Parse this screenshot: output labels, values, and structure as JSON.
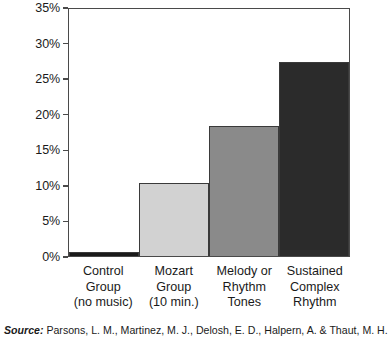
{
  "chart_data": {
    "type": "bar",
    "title": "",
    "subtitle": "",
    "xlabel": "",
    "ylabel": "",
    "categories": [
      "Control Group (no music)",
      "Mozart Group (10 min.)",
      "Melody or Rhythm Tones",
      "Sustained Complex Rhythm"
    ],
    "category_lines": [
      [
        "Control",
        "Group",
        "(no music)"
      ],
      [
        "Mozart",
        "Group",
        "(10 min.)"
      ],
      [
        "Melody or",
        "Rhythm",
        "Tones"
      ],
      [
        "Sustained",
        "Complex",
        "Rhythm"
      ]
    ],
    "values": [
      0.5,
      10.2,
      18.3,
      27.3
    ],
    "value_labels": [
      "0.5%",
      "10.2%",
      "18.3%",
      "27.3%"
    ],
    "bar_colors": [
      "#1a1a1a",
      "#d2d2d2",
      "#8a8a8a",
      "#2b2b2b"
    ],
    "bar_border_color": "#3a3a3a",
    "ylim": [
      0,
      35
    ],
    "ytick_values": [
      0,
      5,
      10,
      15,
      20,
      25,
      30,
      35
    ],
    "ytick_labels": [
      "0%",
      "5%",
      "10%",
      "15%",
      "20%",
      "25%",
      "30%",
      "35%"
    ],
    "grid": false,
    "legend": false,
    "legend_position": "none",
    "axis_color": "#4a4a4a",
    "plot_background": "#ffffff"
  },
  "source": {
    "label": "Source:",
    "text": "Parsons, L. M., Martinez, M. J., Delosh, E. D., Halpern, A. & Thaut, M. H."
  }
}
